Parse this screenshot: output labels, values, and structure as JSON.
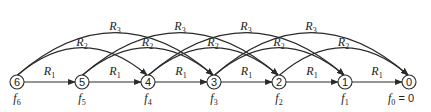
{
  "diagram": {
    "title": "",
    "node_y": 82,
    "node_radius": 7,
    "stroke_color": "#2a2a2a",
    "nodes": [
      {
        "id": "6",
        "label": "6",
        "x": 17,
        "f_label": "f",
        "f_sub": "6",
        "f_suffix": ""
      },
      {
        "id": "5",
        "label": "5",
        "x": 82,
        "f_label": "f",
        "f_sub": "5",
        "f_suffix": ""
      },
      {
        "id": "4",
        "label": "4",
        "x": 148,
        "f_label": "f",
        "f_sub": "4",
        "f_suffix": ""
      },
      {
        "id": "3",
        "label": "3",
        "x": 214,
        "f_label": "f",
        "f_sub": "3",
        "f_suffix": ""
      },
      {
        "id": "2",
        "label": "2",
        "x": 279,
        "f_label": "f",
        "f_sub": "2",
        "f_suffix": ""
      },
      {
        "id": "1",
        "label": "1",
        "x": 345,
        "f_label": "f",
        "f_sub": "1",
        "f_suffix": ""
      },
      {
        "id": "0",
        "label": "0",
        "x": 409,
        "f_label": "f",
        "f_sub": "0",
        "f_suffix": " = 0"
      }
    ],
    "edges": [
      {
        "from": "6",
        "to": "5",
        "label": "R",
        "sub": "1",
        "kind": "straight"
      },
      {
        "from": "5",
        "to": "4",
        "label": "R",
        "sub": "1",
        "kind": "straight"
      },
      {
        "from": "4",
        "to": "3",
        "label": "R",
        "sub": "1",
        "kind": "straight"
      },
      {
        "from": "3",
        "to": "2",
        "label": "R",
        "sub": "1",
        "kind": "straight"
      },
      {
        "from": "2",
        "to": "1",
        "label": "R",
        "sub": "1",
        "kind": "straight"
      },
      {
        "from": "1",
        "to": "0",
        "label": "R",
        "sub": "1",
        "kind": "straight"
      },
      {
        "from": "6",
        "to": "4",
        "label": "R",
        "sub": "2",
        "kind": "arc2"
      },
      {
        "from": "5",
        "to": "3",
        "label": "R",
        "sub": "2",
        "kind": "arc2"
      },
      {
        "from": "4",
        "to": "2",
        "label": "R",
        "sub": "2",
        "kind": "arc2"
      },
      {
        "from": "3",
        "to": "1",
        "label": "R",
        "sub": "2",
        "kind": "arc2"
      },
      {
        "from": "2",
        "to": "0",
        "label": "R",
        "sub": "2",
        "kind": "arc2"
      },
      {
        "from": "6",
        "to": "3",
        "label": "R",
        "sub": "3",
        "kind": "arc3"
      },
      {
        "from": "5",
        "to": "2",
        "label": "R",
        "sub": "3",
        "kind": "arc3"
      },
      {
        "from": "4",
        "to": "1",
        "label": "R",
        "sub": "3",
        "kind": "arc3"
      },
      {
        "from": "3",
        "to": "0",
        "label": "R",
        "sub": "3",
        "kind": "arc3"
      }
    ]
  }
}
